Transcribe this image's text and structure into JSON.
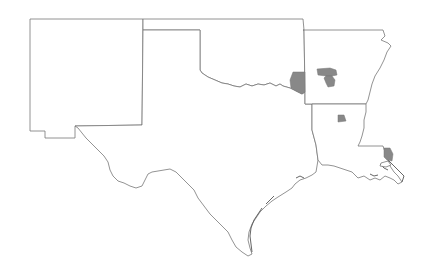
{
  "map": {
    "title": "Map of selected counties in the South Central United States",
    "states": [
      {
        "id": "new-mexico",
        "name": "New Mexico"
      },
      {
        "id": "oklahoma",
        "name": "Oklahoma"
      },
      {
        "id": "texas",
        "name": "Texas"
      },
      {
        "id": "arkansas",
        "name": "Arkansas"
      },
      {
        "id": "louisiana",
        "name": "Louisiana"
      }
    ],
    "highlighted_regions": [
      {
        "id": "oklahoma-southeast-county",
        "state": "Oklahoma"
      },
      {
        "id": "arkansas-central-county-group-north",
        "state": "Arkansas"
      },
      {
        "id": "arkansas-central-county-group-south",
        "state": "Arkansas"
      },
      {
        "id": "arkansas-south-county",
        "state": "Arkansas"
      },
      {
        "id": "louisiana-southeast-parish",
        "state": "Louisiana"
      }
    ],
    "colors": {
      "background": "#ffffff",
      "state_fill": "#ffffff",
      "border": "#777777",
      "highlight": "#888888"
    }
  }
}
